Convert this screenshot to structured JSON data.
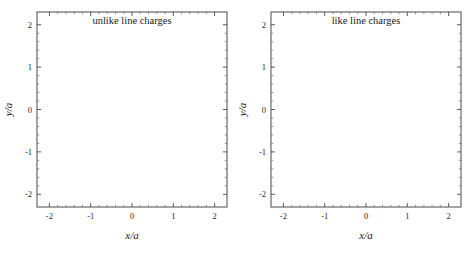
{
  "figure": {
    "background_color": "#ffffff",
    "line_color": "#1c1c1c",
    "frame_color": "#4a4a4a"
  },
  "chart_data": [
    {
      "type": "line",
      "panel_id": "unlike-line-charges",
      "title": "unlike line charges",
      "xlabel": "x/a",
      "ylabel": "y/a",
      "xlim": [
        -2.3,
        2.3
      ],
      "ylim": [
        -2.3,
        2.3
      ],
      "xticks": [
        -2,
        -1,
        0,
        1,
        2
      ],
      "xticklabels": [
        "-2",
        "-1",
        "0",
        "1",
        "2"
      ],
      "yticks": [
        -2,
        -1,
        0,
        1,
        2
      ],
      "yticklabels": [
        "-2",
        "-1",
        "0",
        "1",
        "2"
      ],
      "grid": false,
      "legend": "none",
      "tick_direction": "in",
      "minor_ticks_per_interval": 4,
      "charges": [
        {
          "x": -1,
          "y": 0,
          "sign": -1,
          "label": "negative line charge",
          "marker": "filled-circle"
        },
        {
          "x": 1,
          "y": 0,
          "sign": 1,
          "label": "positive line charge",
          "marker": "filled-circle"
        }
      ],
      "field_type": "dipole",
      "streamline_count": 26,
      "arrow_style": "perpendicular-tick",
      "description": "Electric field streamlines of two unlike (opposite sign) parallel line charges at x/a = -1 and x/a = +1; lines emanate from the charge at +1 and terminate on the charge at -1 forming closed dipole arcs."
    },
    {
      "type": "line",
      "panel_id": "like-line-charges",
      "title": "like line charges",
      "xlabel": "x/a",
      "ylabel": "y/a",
      "xlim": [
        -2.3,
        2.3
      ],
      "ylim": [
        -2.3,
        2.3
      ],
      "xticks": [
        -2,
        -1,
        0,
        1,
        2
      ],
      "xticklabels": [
        "-2",
        "-1",
        "0",
        "1",
        "2"
      ],
      "yticks": [
        -2,
        -1,
        0,
        1,
        2
      ],
      "yticklabels": [
        "-2",
        "-1",
        "0",
        "1",
        "2"
      ],
      "grid": false,
      "legend": "none",
      "tick_direction": "in",
      "minor_ticks_per_interval": 4,
      "charges": [
        {
          "x": -1,
          "y": 0,
          "sign": 1,
          "label": "positive line charge",
          "marker": "filled-circle"
        },
        {
          "x": 1,
          "y": 0,
          "sign": 1,
          "label": "positive line charge",
          "marker": "filled-circle"
        }
      ],
      "field_type": "like-pair",
      "streamline_count": 26,
      "arrow_style": "perpendicular-tick",
      "neutral_point": {
        "x": 0,
        "y": 0,
        "label": "saddle point"
      },
      "description": "Electric field streamlines of two like (same sign) parallel line charges at x/a = -1 and x/a = +1; lines radiate outward from both charges with an X-shaped null (saddle) at the origin."
    }
  ]
}
